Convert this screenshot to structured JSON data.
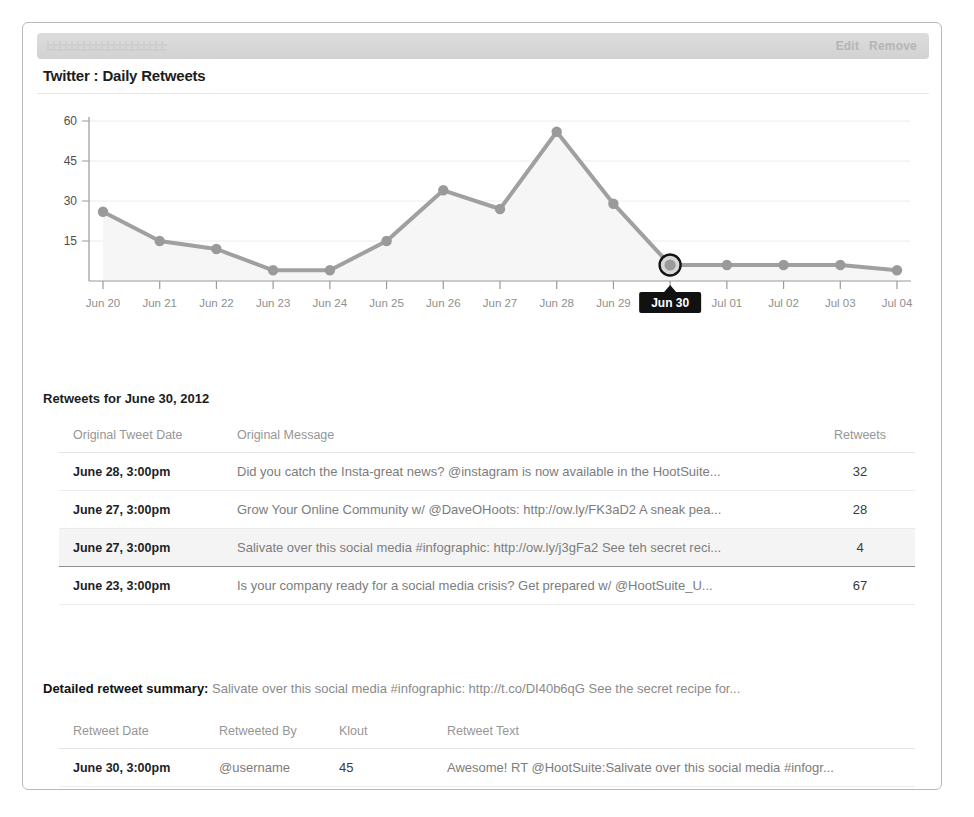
{
  "module": {
    "title": "Twitter : Daily Retweets",
    "actions": [
      {
        "name": "edit-link",
        "label": "Edit"
      },
      {
        "name": "remove-link",
        "label": "Remove"
      }
    ]
  },
  "chart_data": {
    "type": "line",
    "title": "Twitter : Daily Retweets",
    "xlabel": "",
    "ylabel": "",
    "categories": [
      "Jun 20",
      "Jun 21",
      "Jun 22",
      "Jun 23",
      "Jun 24",
      "Jun 25",
      "Jun 26",
      "Jun 27",
      "Jun 28",
      "Jun 29",
      "Jun 30",
      "Jul 01",
      "Jul 02",
      "Jul 03",
      "Jul 04"
    ],
    "values": [
      26,
      15,
      12,
      4,
      4,
      15,
      34,
      27,
      56,
      29,
      6,
      6,
      6,
      6,
      4
    ],
    "ylim": [
      0,
      60
    ],
    "yticks": [
      15,
      30,
      45,
      60
    ],
    "grid": true,
    "legend": "none",
    "selected_index": 10,
    "selected_label": "Jun 30",
    "series_color": "#a0a0a0",
    "area_color": "#f6f6f6",
    "tooltip_bg": "#111111",
    "tooltip_fg": "#ffffff"
  },
  "retweets_section": {
    "heading": "Retweets for June 30, 2012",
    "columns": [
      "Original Tweet Date",
      "Original Message",
      "Retweets"
    ],
    "rows": [
      {
        "date": "June 28, 3:00pm",
        "message": "Did you catch the Insta-great news? @instagram is now available in the HootSuite...",
        "retweets": "32",
        "selected": false
      },
      {
        "date": "June 27, 3:00pm",
        "message": "Grow Your Online Community w/ @DaveOHoots: http://ow.ly/FK3aD2 A sneak pea...",
        "retweets": "28",
        "selected": false
      },
      {
        "date": "June 27, 3:00pm",
        "message": "Salivate over this social media #infographic: http://ow.ly/j3gFa2 See teh secret reci...",
        "retweets": "4",
        "selected": true
      },
      {
        "date": "June 23, 3:00pm",
        "message": "Is your company ready for a social media crisis? Get prepared w/ @HootSuite_U...",
        "retweets": "67",
        "selected": false
      }
    ]
  },
  "detail_section": {
    "summary_label": "Detailed retweet summary:",
    "summary_text": "Salivate over this social media #infographic: http://t.co/DI40b6qG See the secret recipe for...",
    "columns": [
      "Retweet Date",
      "Retweeted By",
      "Klout",
      "Retweet Text"
    ],
    "rows": [
      {
        "date": "June 30, 3:00pm",
        "by": "@username",
        "klout": "45",
        "text": "Awesome! RT @HootSuite:Salivate over this social media #infogr..."
      }
    ]
  }
}
